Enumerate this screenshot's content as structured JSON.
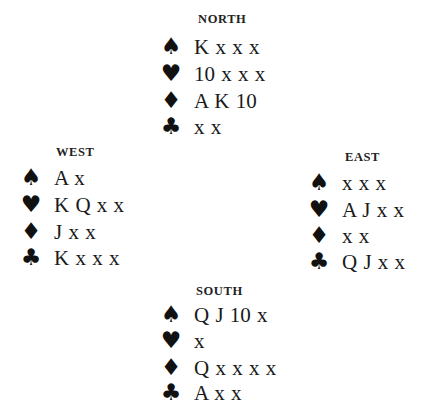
{
  "hands": {
    "north": {
      "label": "NORTH",
      "suits": [
        {
          "suit": "spades",
          "symbol": "♠",
          "cards": "K x x x"
        },
        {
          "suit": "hearts",
          "symbol": "♥",
          "cards": "10 x x x"
        },
        {
          "suit": "diamonds",
          "symbol": "♦",
          "cards": "A K 10"
        },
        {
          "suit": "clubs",
          "symbol": "♣",
          "cards": "x x"
        }
      ]
    },
    "west": {
      "label": "WEST",
      "suits": [
        {
          "suit": "spades",
          "symbol": "♠",
          "cards": "A x"
        },
        {
          "suit": "hearts",
          "symbol": "♥",
          "cards": "K Q x x"
        },
        {
          "suit": "diamonds",
          "symbol": "♦",
          "cards": "J x x"
        },
        {
          "suit": "clubs",
          "symbol": "♣",
          "cards": "K x x x"
        }
      ]
    },
    "east": {
      "label": "EAST",
      "suits": [
        {
          "suit": "spades",
          "symbol": "♠",
          "cards": "x x x"
        },
        {
          "suit": "hearts",
          "symbol": "♥",
          "cards": "A J x x"
        },
        {
          "suit": "diamonds",
          "symbol": "♦",
          "cards": "x x"
        },
        {
          "suit": "clubs",
          "symbol": "♣",
          "cards": "Q J x x"
        }
      ]
    },
    "south": {
      "label": "SOUTH",
      "suits": [
        {
          "suit": "spades",
          "symbol": "♠",
          "cards": "Q J 10 x"
        },
        {
          "suit": "hearts",
          "symbol": "♥",
          "cards": "x"
        },
        {
          "suit": "diamonds",
          "symbol": "♦",
          "cards": "Q x x x x"
        },
        {
          "suit": "clubs",
          "symbol": "♣",
          "cards": "A x x"
        }
      ]
    }
  }
}
